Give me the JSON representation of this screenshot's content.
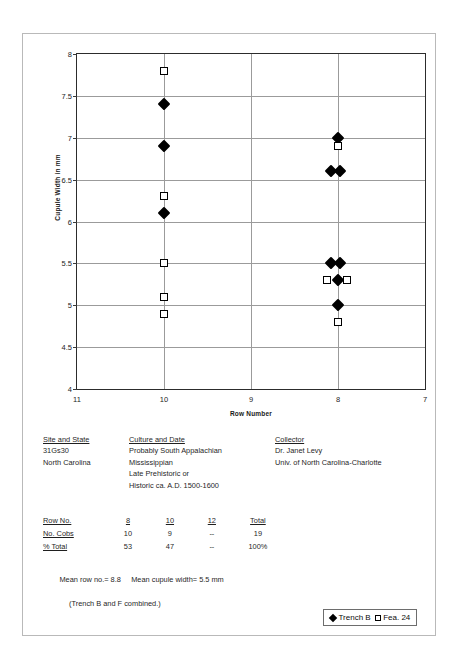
{
  "chart_data": {
    "type": "scatter",
    "title": "",
    "xlabel": "Row Number",
    "ylabel": "Cupule Width in mm",
    "xticks": [
      11,
      10,
      9,
      8,
      7
    ],
    "xlim": [
      11,
      7
    ],
    "x_axis_reversed": true,
    "yticks": [
      4,
      4.5,
      5,
      5.5,
      6,
      6.5,
      7,
      7.5,
      8
    ],
    "ylim": [
      4,
      8
    ],
    "grid": "both",
    "legend_position": "bottom-right-outside",
    "series": [
      {
        "name": "Trench B",
        "marker": "filled-diamond",
        "color": "#000000",
        "points": [
          {
            "x": 10,
            "y": 7.4,
            "dx": 0
          },
          {
            "x": 10,
            "y": 6.9,
            "dx": 0
          },
          {
            "x": 10,
            "y": 6.1,
            "dx": 0
          },
          {
            "x": 8,
            "y": 7.0,
            "dx": 0
          },
          {
            "x": 8,
            "y": 6.6,
            "dx": -7
          },
          {
            "x": 8,
            "y": 6.6,
            "dx": 2
          },
          {
            "x": 8,
            "y": 5.5,
            "dx": -7
          },
          {
            "x": 8,
            "y": 5.5,
            "dx": 2
          },
          {
            "x": 8,
            "y": 5.3,
            "dx": 0
          },
          {
            "x": 8,
            "y": 5.0,
            "dx": 0
          }
        ]
      },
      {
        "name": "Fea. 24",
        "marker": "open-square",
        "color": "#000000",
        "points": [
          {
            "x": 10,
            "y": 7.8,
            "dx": 0
          },
          {
            "x": 10,
            "y": 6.3,
            "dx": 0
          },
          {
            "x": 10,
            "y": 5.5,
            "dx": 0
          },
          {
            "x": 10,
            "y": 5.1,
            "dx": 0
          },
          {
            "x": 10,
            "y": 4.9,
            "dx": 0
          },
          {
            "x": 8,
            "y": 6.9,
            "dx": 0
          },
          {
            "x": 8,
            "y": 5.3,
            "dx": -11
          },
          {
            "x": 8,
            "y": 5.3,
            "dx": 9
          },
          {
            "x": 8,
            "y": 4.8,
            "dx": 0
          }
        ]
      }
    ]
  },
  "legend": {
    "series_1_label": "Trench B",
    "series_2_label": "Fea. 24"
  },
  "info": {
    "site": {
      "heading": "Site and State",
      "lines": [
        "31Gs30",
        "North Carolina"
      ]
    },
    "culture": {
      "heading": "Culture and Date",
      "lines": [
        "Probably South Appalachian",
        "Mississippian",
        "Late Prehistoric or",
        "Historic ca. A.D. 1500-1600"
      ]
    },
    "collector": {
      "heading": "Collector",
      "lines": [
        "Dr. Janet Levy",
        "Univ. of North Carolina-Charlotte"
      ]
    }
  },
  "stats_table": {
    "columns": [
      "8",
      "10",
      "12",
      "Total"
    ],
    "row_label_header": "Row No.",
    "rows": [
      {
        "label": "No. Cobs",
        "values": [
          "10",
          "9",
          "--",
          "19"
        ]
      },
      {
        "label": "% Total",
        "values": [
          "53",
          "47",
          "--",
          "100%"
        ]
      }
    ]
  },
  "means": {
    "mean_row_no": "Mean row no.= 8.8",
    "mean_cupule_width": "Mean cupule width= 5.5 mm",
    "note": "(Trench B and F combined.)"
  }
}
